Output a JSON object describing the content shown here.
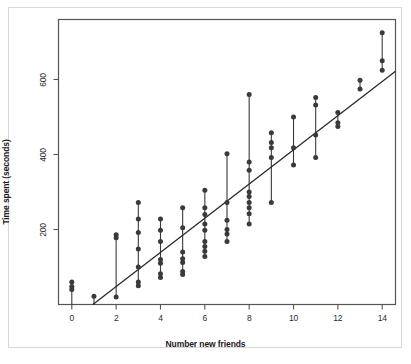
{
  "chart_data": {
    "type": "scatter",
    "title": "",
    "xlabel": "Number new friends",
    "ylabel": "Time spent (seconds)",
    "xlim": [
      -0.6,
      14.6
    ],
    "ylim": [
      0,
      760
    ],
    "xticks": [
      0,
      2,
      4,
      6,
      8,
      10,
      12,
      14
    ],
    "xticklabels": [
      "0",
      "2",
      "4",
      "6",
      "8",
      "10",
      "12",
      "14"
    ],
    "yticks": [
      200,
      400,
      600
    ],
    "yticklabels": [
      "200",
      "400",
      "600"
    ],
    "grid": false,
    "legend": null,
    "marker_color": "#3a3a3a",
    "line_color": "#2a2a2a",
    "frame_color": "#555555",
    "series": [
      {
        "name": "observations",
        "points": [
          {
            "x": 0,
            "y": 60
          },
          {
            "x": 0,
            "y": 48
          },
          {
            "x": 0,
            "y": 40
          },
          {
            "x": 1,
            "y": 22
          },
          {
            "x": 2,
            "y": 186
          },
          {
            "x": 2,
            "y": 178
          },
          {
            "x": 2,
            "y": 20
          },
          {
            "x": 3,
            "y": 272
          },
          {
            "x": 3,
            "y": 228
          },
          {
            "x": 3,
            "y": 192
          },
          {
            "x": 3,
            "y": 148
          },
          {
            "x": 3,
            "y": 100
          },
          {
            "x": 3,
            "y": 60
          },
          {
            "x": 3,
            "y": 50
          },
          {
            "x": 4,
            "y": 228
          },
          {
            "x": 4,
            "y": 198
          },
          {
            "x": 4,
            "y": 168
          },
          {
            "x": 4,
            "y": 120
          },
          {
            "x": 4,
            "y": 110
          },
          {
            "x": 4,
            "y": 82
          },
          {
            "x": 4,
            "y": 72
          },
          {
            "x": 5,
            "y": 258
          },
          {
            "x": 5,
            "y": 205
          },
          {
            "x": 5,
            "y": 140
          },
          {
            "x": 5,
            "y": 122
          },
          {
            "x": 5,
            "y": 112
          },
          {
            "x": 5,
            "y": 88
          },
          {
            "x": 5,
            "y": 80
          },
          {
            "x": 6,
            "y": 305
          },
          {
            "x": 6,
            "y": 258
          },
          {
            "x": 6,
            "y": 240
          },
          {
            "x": 6,
            "y": 215
          },
          {
            "x": 6,
            "y": 198
          },
          {
            "x": 6,
            "y": 168
          },
          {
            "x": 6,
            "y": 155
          },
          {
            "x": 6,
            "y": 142
          },
          {
            "x": 6,
            "y": 128
          },
          {
            "x": 7,
            "y": 402
          },
          {
            "x": 7,
            "y": 272
          },
          {
            "x": 7,
            "y": 225
          },
          {
            "x": 7,
            "y": 200
          },
          {
            "x": 7,
            "y": 188
          },
          {
            "x": 7,
            "y": 168
          },
          {
            "x": 8,
            "y": 560
          },
          {
            "x": 8,
            "y": 380
          },
          {
            "x": 8,
            "y": 358
          },
          {
            "x": 8,
            "y": 300
          },
          {
            "x": 8,
            "y": 288
          },
          {
            "x": 8,
            "y": 272
          },
          {
            "x": 8,
            "y": 258
          },
          {
            "x": 8,
            "y": 242
          },
          {
            "x": 8,
            "y": 215
          },
          {
            "x": 9,
            "y": 458
          },
          {
            "x": 9,
            "y": 432
          },
          {
            "x": 9,
            "y": 418
          },
          {
            "x": 9,
            "y": 392
          },
          {
            "x": 9,
            "y": 272
          },
          {
            "x": 10,
            "y": 500
          },
          {
            "x": 10,
            "y": 418
          },
          {
            "x": 10,
            "y": 372
          },
          {
            "x": 11,
            "y": 552
          },
          {
            "x": 11,
            "y": 532
          },
          {
            "x": 11,
            "y": 452
          },
          {
            "x": 11,
            "y": 392
          },
          {
            "x": 12,
            "y": 512
          },
          {
            "x": 12,
            "y": 485
          },
          {
            "x": 12,
            "y": 475
          },
          {
            "x": 13,
            "y": 598
          },
          {
            "x": 13,
            "y": 575
          },
          {
            "x": 14,
            "y": 725
          },
          {
            "x": 14,
            "y": 650
          },
          {
            "x": 14,
            "y": 625
          }
        ]
      }
    ],
    "stems": [
      {
        "x": 0,
        "ymin": 0,
        "ymax": 60
      },
      {
        "x": 1,
        "ymin": 0,
        "ymax": 22
      },
      {
        "x": 2,
        "ymin": 20,
        "ymax": 186
      },
      {
        "x": 3,
        "ymin": 50,
        "ymax": 272
      },
      {
        "x": 4,
        "ymin": 72,
        "ymax": 228
      },
      {
        "x": 5,
        "ymin": 80,
        "ymax": 258
      },
      {
        "x": 6,
        "ymin": 128,
        "ymax": 305
      },
      {
        "x": 7,
        "ymin": 168,
        "ymax": 402
      },
      {
        "x": 8,
        "ymin": 215,
        "ymax": 560
      },
      {
        "x": 9,
        "ymin": 272,
        "ymax": 458
      },
      {
        "x": 10,
        "ymin": 372,
        "ymax": 500
      },
      {
        "x": 11,
        "ymin": 392,
        "ymax": 552
      },
      {
        "x": 12,
        "ymin": 475,
        "ymax": 512
      },
      {
        "x": 13,
        "ymin": 575,
        "ymax": 598
      },
      {
        "x": 14,
        "ymin": 625,
        "ymax": 725
      }
    ],
    "fit_line": {
      "name": "regression-line",
      "x_start": 0.95,
      "y_start": 0,
      "x_end": 14.6,
      "y_end": 622,
      "slope": 45.6,
      "intercept": -43
    }
  }
}
